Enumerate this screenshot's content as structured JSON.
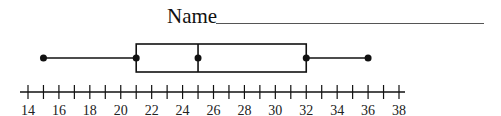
{
  "header": {
    "name_label": "Name",
    "name_field_value": ""
  },
  "chart_data": {
    "type": "boxplot",
    "title": "",
    "xlabel": "",
    "ylabel": "",
    "orientation": "horizontal",
    "axis": {
      "min": 14,
      "max": 38,
      "major_tick_step": 1,
      "label_step": 2,
      "tick_labels": [
        "14",
        "16",
        "18",
        "20",
        "22",
        "24",
        "26",
        "28",
        "30",
        "32",
        "34",
        "36",
        "38"
      ]
    },
    "five_number_summary": {
      "min": 15,
      "q1": 21,
      "median": 25,
      "q3": 32,
      "max": 36
    },
    "grid": false,
    "legend": null
  },
  "colors": {
    "stroke": "#111111",
    "background": "#ffffff"
  }
}
